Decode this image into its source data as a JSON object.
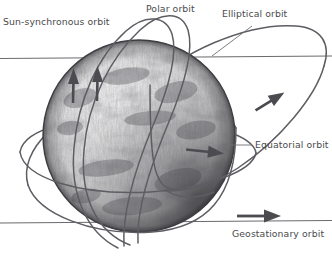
{
  "diagram": {
    "style": "pencil sketch",
    "canvas": {
      "width": 332,
      "height": 257
    },
    "background_color": "#ffffff",
    "ink_color": "#5d5d63",
    "label_color": "#4a4a4e",
    "globe": {
      "name": "Earth",
      "center_x": 139,
      "center_y": 136,
      "radius": 96,
      "shading": "pencil cross-hatch, light from upper-left, dark terminator lower-right"
    },
    "labels": [
      {
        "id": "sun-synchronous",
        "text": "Sun-synchronous orbit",
        "x": 3,
        "y": 25
      },
      {
        "id": "polar",
        "text": "Polar orbit",
        "x": 146,
        "y": 12
      },
      {
        "id": "elliptical",
        "text": "Elliptical orbit",
        "x": 222,
        "y": 17
      },
      {
        "id": "equatorial",
        "text": "Equatorial orbit",
        "x": 255,
        "y": 148
      },
      {
        "id": "geostationary",
        "text": "Geostationary orbit",
        "x": 232,
        "y": 237
      }
    ],
    "orbits": [
      {
        "id": "sun-synchronous",
        "type": "near-polar inclined ellipse",
        "direction": "northbound",
        "has_arrow": true
      },
      {
        "id": "polar",
        "type": "polar ellipse",
        "direction": "northbound",
        "has_arrow": true
      },
      {
        "id": "elliptical",
        "type": "large eccentric ellipse",
        "direction": "counter-clockwise",
        "has_arrow": true
      },
      {
        "id": "equatorial",
        "type": "equatorial ellipse",
        "direction": "eastbound",
        "has_arrow": true
      },
      {
        "id": "geostationary",
        "type": "horizontal line at equatorial plane",
        "direction": "eastbound",
        "has_arrow": true
      }
    ],
    "horizon_lines": [
      {
        "id": "upper-plane-line",
        "y": 58
      },
      {
        "id": "geostationary-plane-line",
        "y": 222
      }
    ],
    "arrows": [
      {
        "id": "polar-arrow-left",
        "x": 73,
        "y": 80,
        "direction": "up"
      },
      {
        "id": "polar-arrow-right",
        "x": 97,
        "y": 78,
        "direction": "up"
      },
      {
        "id": "elliptical-arrow",
        "x": 272,
        "y": 95,
        "direction": "up-right"
      },
      {
        "id": "equatorial-arrow",
        "x": 218,
        "y": 153,
        "direction": "right"
      },
      {
        "id": "geostationary-arrow",
        "x": 248,
        "y": 218,
        "direction": "right"
      }
    ]
  }
}
